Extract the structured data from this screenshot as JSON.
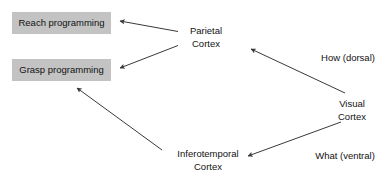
{
  "diagram": {
    "type": "two-streams-flow-diagram",
    "background_color": "#ffffff",
    "box_fill_color": "#c3c3c3",
    "text_color": "#121212",
    "arrow_color": "#3a3a3a",
    "boxes": [
      {
        "id": "reach",
        "label": "Reach programming"
      },
      {
        "id": "grasp",
        "label": "Grasp programming"
      }
    ],
    "nodes": [
      {
        "id": "parietal",
        "line1": "Parietal",
        "line2": "Cortex"
      },
      {
        "id": "inferotemporal",
        "line1": "Inferotemporal",
        "line2": "Cortex"
      },
      {
        "id": "visual",
        "line1": "Visual",
        "line2": "Cortex"
      }
    ],
    "edge_labels": [
      {
        "id": "dorsal",
        "label": "How (dorsal)"
      },
      {
        "id": "ventral",
        "label": "What (ventral)"
      }
    ],
    "edges": [
      {
        "id": "parietal-to-reach",
        "from": "parietal",
        "to": "reach"
      },
      {
        "id": "parietal-to-grasp",
        "from": "parietal",
        "to": "grasp"
      },
      {
        "id": "visual-to-parietal",
        "from": "visual",
        "to": "parietal",
        "label": "How (dorsal)"
      },
      {
        "id": "visual-to-inferotemporal",
        "from": "visual",
        "to": "inferotemporal",
        "label": "What (ventral)"
      },
      {
        "id": "inferotemporal-to-grasp",
        "from": "inferotemporal",
        "to": "grasp"
      }
    ]
  }
}
